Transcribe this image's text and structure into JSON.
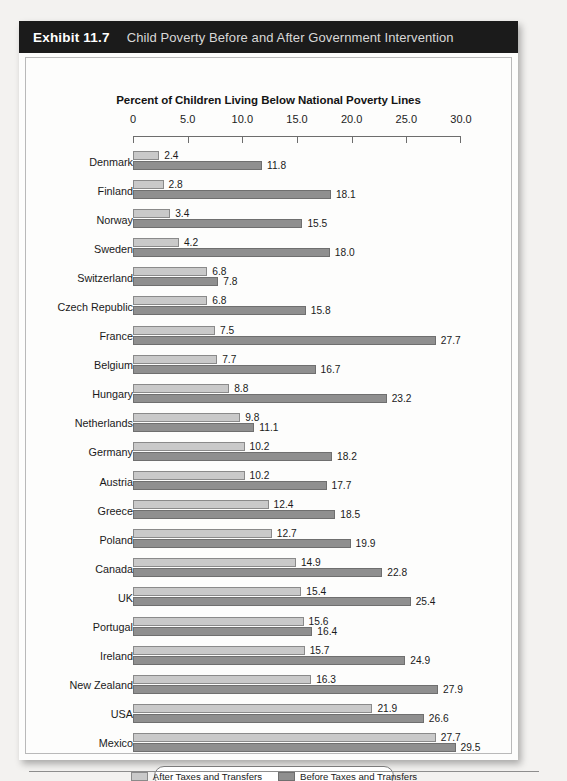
{
  "exhibit": {
    "number": "Exhibit 11.7",
    "title": "Child Poverty Before and After Government Intervention"
  },
  "chart_data": {
    "type": "bar",
    "orientation": "horizontal",
    "title": "Percent of Children Living Below National Poverty Lines",
    "xlabel": "",
    "ylabel": "",
    "xlim": [
      0,
      30
    ],
    "grid": false,
    "legend_position": "bottom",
    "tick_labels": [
      "0",
      "5.0",
      "10.0",
      "15.0",
      "20.0",
      "25.0",
      "30.0"
    ],
    "ticks": [
      0,
      5,
      10,
      15,
      20,
      25,
      30
    ],
    "categories": [
      "Denmark",
      "Finland",
      "Norway",
      "Sweden",
      "Switzerland",
      "Czech Republic",
      "France",
      "Belgium",
      "Hungary",
      "Netherlands",
      "Germany",
      "Austria",
      "Greece",
      "Poland",
      "Canada",
      "UK",
      "Portugal",
      "Ireland",
      "New Zealand",
      "USA",
      "Mexico"
    ],
    "series": [
      {
        "name": "After Taxes and Transfers",
        "color": "#c9c9c9",
        "values": [
          2.4,
          2.8,
          3.4,
          4.2,
          6.8,
          6.8,
          7.5,
          7.7,
          8.8,
          9.8,
          10.2,
          10.2,
          12.4,
          12.7,
          14.9,
          15.4,
          15.6,
          15.7,
          16.3,
          21.9,
          27.7
        ],
        "labels": [
          "2.4",
          "2.8",
          "3.4",
          "4.2",
          "6.8",
          "6.8",
          "7.5",
          "7.7",
          "8.8",
          "9.8",
          "10.2",
          "10.2",
          "12.4",
          "12.7",
          "14.9",
          "15.4",
          "15.6",
          "15.7",
          "16.3",
          "21.9",
          "27.7"
        ]
      },
      {
        "name": "Before Taxes and Transfers",
        "color": "#8f8f8f",
        "values": [
          11.8,
          18.1,
          15.5,
          18.0,
          7.8,
          15.8,
          27.7,
          16.7,
          23.2,
          11.1,
          18.2,
          17.7,
          18.5,
          19.9,
          22.8,
          25.4,
          16.4,
          24.9,
          27.9,
          26.6,
          29.5
        ],
        "labels": [
          "11.8",
          "18.1",
          "15.5",
          "18.0",
          "7.8",
          "15.8",
          "27.7",
          "16.7",
          "23.2",
          "11.1",
          "18.2",
          "17.7",
          "18.5",
          "19.9",
          "22.8",
          "25.4",
          "16.4",
          "24.9",
          "27.9",
          "26.6",
          "29.5"
        ]
      }
    ]
  },
  "legend": {
    "items": [
      {
        "label": "After Taxes and Transfers",
        "swatch": "after"
      },
      {
        "label": "Before Taxes and Transfers",
        "swatch": "before"
      }
    ]
  }
}
